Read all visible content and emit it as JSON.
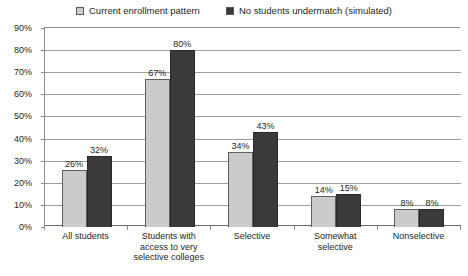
{
  "chart_data": {
    "type": "bar",
    "title": "",
    "xlabel": "",
    "ylabel": "",
    "ylim": [
      0,
      90
    ],
    "ytick_labels": [
      "90%",
      "80%",
      "70%",
      "60%",
      "50%",
      "40%",
      "30%",
      "20%",
      "10%",
      "0%"
    ],
    "ytick_values": [
      90,
      80,
      70,
      60,
      50,
      40,
      30,
      20,
      10,
      0
    ],
    "grid": true,
    "legend_position": "top-center",
    "categories": [
      "All students",
      "Students with access to very selective colleges",
      "Selective",
      "Somewhat selective",
      "Nonselective"
    ],
    "category_lines": [
      [
        "All students"
      ],
      [
        "Students with",
        "access to very",
        "selective colleges"
      ],
      [
        "Selective"
      ],
      [
        "Somewhat",
        "selective"
      ],
      [
        "Nonselective"
      ]
    ],
    "series": [
      {
        "name": "Current enrollment pattern",
        "color": "#cbcbcb",
        "values": [
          26,
          67,
          34,
          14,
          8
        ],
        "labels": [
          "26%",
          "67%",
          "34%",
          "14%",
          "8%"
        ]
      },
      {
        "name": "No students undermatch (simulated)",
        "color": "#3a3a3a",
        "values": [
          32,
          80,
          43,
          15,
          8
        ],
        "labels": [
          "32%",
          "80%",
          "43%",
          "15%",
          "8%"
        ]
      }
    ]
  },
  "legend": {
    "items": [
      {
        "label": "Current enrollment pattern",
        "swatch": "light"
      },
      {
        "label": "No students undermatch (simulated)",
        "swatch": "dark"
      }
    ]
  },
  "colors": {
    "series_light": "#cbcbcb",
    "series_dark": "#3a3a3a",
    "gridline": "#9d9d9d",
    "axis": "#8c8c8c",
    "text": "#231f20",
    "background": "#ffffff"
  }
}
